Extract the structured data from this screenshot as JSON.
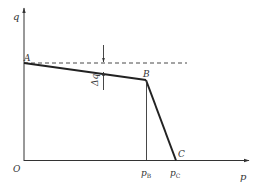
{
  "diagram": {
    "type": "piecewise-linear q-p curve",
    "colors": {
      "line": "#222222",
      "axis": "#333333",
      "background": "#ffffff"
    },
    "axes": {
      "y_label": "q",
      "x_label": "p",
      "origin_label": "O"
    },
    "points": {
      "A": {
        "label": "A"
      },
      "B": {
        "label": "B"
      },
      "C": {
        "label": "C"
      }
    },
    "ticks": {
      "pB": {
        "base": "p",
        "sub": "B"
      },
      "pC": {
        "base": "p",
        "sub": "C"
      }
    },
    "annotation": {
      "delta": "Δq"
    }
  }
}
